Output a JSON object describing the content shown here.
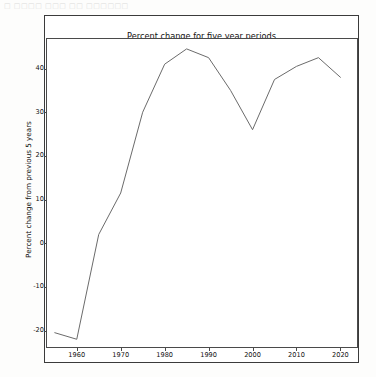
{
  "artifact_text": "□ □□□□ □□□ □□ □□□□□□",
  "chart_data": {
    "type": "line",
    "title": "Percent change for five year periods\nof world population aged 100+",
    "title_line1": "Percent change for five year periods",
    "title_line2": "of world population aged 100+",
    "xlabel": "",
    "ylabel": "Percent change from previous 5 years",
    "xlim": [
      1953,
      2024
    ],
    "ylim": [
      -24,
      47
    ],
    "xticks": [
      1960,
      1970,
      1980,
      1990,
      2000,
      2010,
      2020
    ],
    "xtick_labels": [
      "1960",
      "1970",
      "1980",
      "1990",
      "2000",
      "2010",
      "2020"
    ],
    "yticks": [
      -20,
      -10,
      0,
      10,
      20,
      30,
      40
    ],
    "ytick_labels": [
      "-20",
      "-10",
      "0",
      "10",
      "20",
      "30",
      "40"
    ],
    "grid": false,
    "legend": false,
    "line_color": "#6b6b6b",
    "line_width": 1,
    "x": [
      1955,
      1960,
      1965,
      1970,
      1975,
      1980,
      1985,
      1990,
      1995,
      2000,
      2005,
      2010,
      2015,
      2020
    ],
    "values": [
      -20.5,
      -22.0,
      2.0,
      11.5,
      30.0,
      41.0,
      44.5,
      42.5,
      35.0,
      26.0,
      37.5,
      40.5,
      42.5,
      38.0
    ],
    "series": [
      {
        "name": "Percent change from previous 5 years",
        "values": [
          -20.5,
          -22.0,
          2.0,
          11.5,
          30.0,
          41.0,
          44.5,
          42.5,
          35.0,
          26.0,
          37.5,
          40.5,
          42.5,
          38.0
        ]
      }
    ]
  }
}
